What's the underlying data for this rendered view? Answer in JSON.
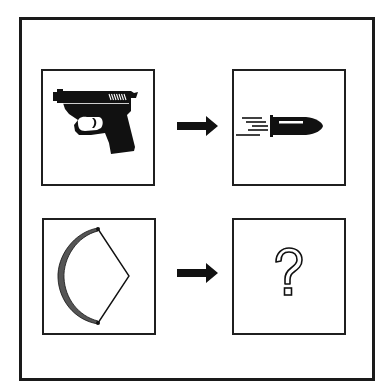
{
  "puzzle": {
    "type": "analogy",
    "rows": [
      {
        "left": {
          "icon": "pistol-icon",
          "label": "Pistol"
        },
        "arrow": {
          "icon": "arrow-right-icon",
          "label": "→"
        },
        "right": {
          "icon": "bullet-icon",
          "label": "Bullet"
        }
      },
      {
        "left": {
          "icon": "bow-icon",
          "label": "Bow"
        },
        "arrow": {
          "icon": "arrow-right-icon",
          "label": "→"
        },
        "right": {
          "icon": "question-mark-icon",
          "label": "?"
        }
      }
    ]
  },
  "colors": {
    "border": "#1a1a1a",
    "icon_fill": "#111111",
    "bow_limb": "#555555",
    "background": "#ffffff"
  }
}
